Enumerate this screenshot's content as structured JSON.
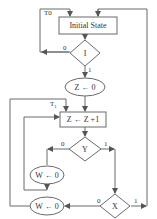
{
  "diagram": {
    "type": "flowchart",
    "colors": {
      "line": "#6a6a6a",
      "text": "#333333",
      "background": "#ffffff"
    },
    "labels": {
      "t0": "T0",
      "t0_sub": "0",
      "t1": "T",
      "t1_sub": "1"
    },
    "nodes": {
      "initial_state": "Initial State",
      "decision_i": "I",
      "z_reset": "Z ← 0",
      "z_increment": "Z ← Z +1",
      "decision_y": "Y",
      "w_reset_upper": "W ← 0",
      "decision_x": "X",
      "w_reset_lower": "W ← 0"
    },
    "edge_labels": {
      "i_zero": "0",
      "i_one": "1",
      "y_zero": "0",
      "y_one": "1",
      "x_zero": "0",
      "x_one": "1"
    },
    "edges": [
      {
        "from": "T0",
        "to": "initial_state"
      },
      {
        "from": "initial_state",
        "to": "decision_i"
      },
      {
        "from": "decision_i",
        "to": "T0",
        "label": "0"
      },
      {
        "from": "decision_i",
        "to": "z_reset",
        "label": "1"
      },
      {
        "from": "z_reset",
        "to": "z_increment"
      },
      {
        "from": "z_increment",
        "to": "decision_y"
      },
      {
        "from": "decision_y",
        "to": "w_reset_upper",
        "label": "0"
      },
      {
        "from": "decision_y",
        "to": "decision_x",
        "label": "1"
      },
      {
        "from": "w_reset_upper",
        "to": "z_increment"
      },
      {
        "from": "decision_x",
        "to": "w_reset_lower",
        "label": "0"
      },
      {
        "from": "decision_x",
        "to": "initial_state",
        "label": "1"
      },
      {
        "from": "w_reset_lower",
        "to": "T1"
      }
    ]
  }
}
